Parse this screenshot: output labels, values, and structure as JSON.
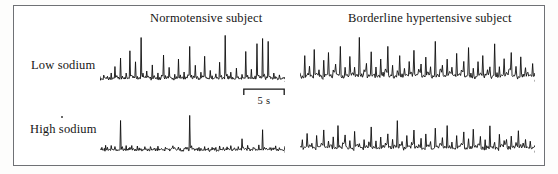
{
  "figure": {
    "column_titles": [
      "Normotensive subject",
      "Borderline hypertensive subject"
    ],
    "row_labels": [
      "Low sodium",
      "High sodium"
    ],
    "scale_bar": {
      "label": "5 s",
      "length_px": 42,
      "seconds": 5
    },
    "colors": {
      "trace": "#101010",
      "frame": "#6f7175",
      "background": "#ffffff",
      "text": "#161616"
    }
  },
  "chart_data": {
    "type": "line",
    "title": "",
    "xlabel": "",
    "ylabel": "",
    "grid": false,
    "legend_position": "none",
    "axis_ranges": {
      "x": [
        0,
        100
      ],
      "y": [
        0,
        1
      ]
    },
    "panels": [
      {
        "name": "normotensive-low-sodium",
        "row": "Low sodium",
        "column": "Normotensive subject",
        "burst_count": 14,
        "description": "Large, well separated sympathetic bursts on a low noise baseline",
        "values": [
          0.07,
          0.05,
          0.12,
          0.06,
          0.09,
          0.05,
          0.16,
          0.07,
          0.3,
          0.1,
          0.08,
          0.48,
          0.09,
          0.06,
          0.14,
          0.07,
          0.62,
          0.12,
          0.08,
          0.4,
          0.1,
          0.07,
          0.88,
          0.14,
          0.09,
          0.22,
          0.08,
          0.06,
          0.34,
          0.1,
          0.07,
          0.18,
          0.06,
          0.12,
          0.55,
          0.09,
          0.07,
          0.26,
          0.08,
          0.05,
          0.15,
          0.07,
          0.44,
          0.1,
          0.06,
          0.2,
          0.08,
          0.12,
          0.7,
          0.13,
          0.08,
          0.3,
          0.09,
          0.06,
          0.18,
          0.1,
          0.5,
          0.08,
          0.06,
          0.24,
          0.09,
          0.07,
          0.14,
          0.06,
          0.36,
          0.1,
          0.07,
          0.92,
          0.15,
          0.09,
          0.2,
          0.07,
          0.05,
          0.28,
          0.08,
          0.06,
          0.16,
          0.09,
          0.58,
          0.11,
          0.07,
          0.22,
          0.06,
          0.1,
          0.78,
          0.14,
          0.08,
          0.85,
          0.13,
          0.07,
          0.8,
          0.12,
          0.06,
          0.18,
          0.08,
          0.05,
          0.12,
          0.07,
          0.09,
          0.06
        ]
      },
      {
        "name": "borderline-hypertensive-low-sodium",
        "row": "Low sodium",
        "column": "Borderline hypertensive subject",
        "burst_count": 24,
        "description": "Dense high frequency bursts with elevated baseline activity",
        "values": [
          0.18,
          0.09,
          0.52,
          0.14,
          0.3,
          0.11,
          0.66,
          0.16,
          0.24,
          0.1,
          0.42,
          0.13,
          0.58,
          0.12,
          0.2,
          0.34,
          0.15,
          0.7,
          0.11,
          0.26,
          0.13,
          0.48,
          0.17,
          0.3,
          0.12,
          0.88,
          0.15,
          0.22,
          0.38,
          0.11,
          0.6,
          0.14,
          0.28,
          0.1,
          0.44,
          0.16,
          0.24,
          0.72,
          0.13,
          0.32,
          0.11,
          0.2,
          0.54,
          0.15,
          0.26,
          0.12,
          0.4,
          0.18,
          0.64,
          0.13,
          0.22,
          0.36,
          0.1,
          0.5,
          0.16,
          0.28,
          0.12,
          0.8,
          0.14,
          0.24,
          0.34,
          0.11,
          0.46,
          0.17,
          0.3,
          0.13,
          0.58,
          0.15,
          0.2,
          0.42,
          0.12,
          0.68,
          0.14,
          0.26,
          0.1,
          0.38,
          0.16,
          0.52,
          0.13,
          0.22,
          0.3,
          0.11,
          0.74,
          0.15,
          0.28,
          0.12,
          0.44,
          0.18,
          0.24,
          0.56,
          0.13,
          0.32,
          0.1,
          0.48,
          0.16,
          0.26,
          0.2,
          0.12,
          0.34,
          0.14
        ]
      },
      {
        "name": "normotensive-high-sodium",
        "row": "High sodium",
        "column": "Normotensive subject",
        "burst_count": 5,
        "description": "Sparse bursts, mostly low amplitude baseline noise",
        "values": [
          0.08,
          0.12,
          0.06,
          0.16,
          0.09,
          0.07,
          0.14,
          0.05,
          0.1,
          0.08,
          0.06,
          0.72,
          0.11,
          0.07,
          0.13,
          0.06,
          0.09,
          0.15,
          0.08,
          0.05,
          0.12,
          0.07,
          0.1,
          0.06,
          0.14,
          0.08,
          0.05,
          0.11,
          0.07,
          0.09,
          0.06,
          0.13,
          0.08,
          0.1,
          0.05,
          0.12,
          0.07,
          0.06,
          0.09,
          0.14,
          0.08,
          0.06,
          0.11,
          0.07,
          0.05,
          0.1,
          0.13,
          0.08,
          0.82,
          0.12,
          0.07,
          0.09,
          0.06,
          0.11,
          0.08,
          0.05,
          0.14,
          0.07,
          0.1,
          0.06,
          0.12,
          0.08,
          0.09,
          0.05,
          0.13,
          0.07,
          0.11,
          0.06,
          0.1,
          0.08,
          0.16,
          0.07,
          0.09,
          0.05,
          0.12,
          0.06,
          0.3,
          0.1,
          0.07,
          0.13,
          0.08,
          0.06,
          0.11,
          0.09,
          0.05,
          0.14,
          0.07,
          0.52,
          0.1,
          0.08,
          0.06,
          0.12,
          0.09,
          0.07,
          0.15,
          0.06,
          0.1,
          0.08,
          0.05,
          0.11
        ]
      },
      {
        "name": "borderline-hypertensive-high-sodium",
        "row": "High sodium",
        "column": "Borderline hypertensive subject",
        "burst_count": 16,
        "description": "Frequent moderate amplitude bursts, remains elevated on high sodium",
        "values": [
          0.12,
          0.28,
          0.1,
          0.44,
          0.14,
          0.22,
          0.09,
          0.36,
          0.13,
          0.18,
          0.52,
          0.11,
          0.26,
          0.15,
          0.32,
          0.1,
          0.6,
          0.13,
          0.2,
          0.38,
          0.12,
          0.24,
          0.09,
          0.46,
          0.16,
          0.18,
          0.11,
          0.3,
          0.14,
          0.22,
          0.56,
          0.12,
          0.26,
          0.1,
          0.34,
          0.15,
          0.2,
          0.42,
          0.11,
          0.28,
          0.13,
          0.72,
          0.16,
          0.22,
          0.1,
          0.36,
          0.14,
          0.24,
          0.48,
          0.12,
          0.18,
          0.3,
          0.11,
          0.4,
          0.15,
          0.26,
          0.09,
          0.54,
          0.13,
          0.2,
          0.32,
          0.12,
          0.62,
          0.14,
          0.24,
          0.1,
          0.38,
          0.16,
          0.22,
          0.44,
          0.11,
          0.28,
          0.13,
          0.5,
          0.15,
          0.2,
          0.34,
          0.1,
          0.26,
          0.12,
          0.58,
          0.14,
          0.22,
          0.09,
          0.4,
          0.16,
          0.24,
          0.3,
          0.11,
          0.36,
          0.13,
          0.2,
          0.46,
          0.15,
          0.18,
          0.28,
          0.1,
          0.24,
          0.12,
          0.14
        ]
      }
    ]
  }
}
